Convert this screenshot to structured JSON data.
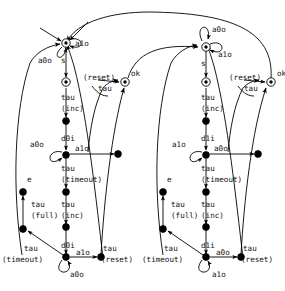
{
  "diagram": {
    "type": "state-transition-diagram",
    "background": "#ffffff",
    "stroke_color": "#000000",
    "text_color": "#111111",
    "width": 285,
    "height": 291,
    "halves": [
      {
        "id": "left",
        "data_in": "d0i",
        "ack_out": "a0o",
        "ack_in": "a1o"
      },
      {
        "id": "right",
        "data_in": "d1i",
        "ack_out": "a1o",
        "ack_in": "a0o"
      }
    ],
    "labels": {
      "start": "s",
      "ok": "ok",
      "e": "e",
      "tau": "tau",
      "inc": "(inc)",
      "full": "(full)",
      "timeout": "(timeout)",
      "reset": "(reset)",
      "a0o": "a0o",
      "a1o": "a1o",
      "d0i": "d0i",
      "d1i": "d1i"
    },
    "left_labels": {
      "self_top": "a1o",
      "self_top2": "a0o",
      "start": "s",
      "tau1": "tau",
      "inc1": "(inc)",
      "din1": "d0i",
      "self_mid": "a0o",
      "ack_mid": "a1o",
      "tau2": "tau",
      "timeout2": "(timeout)",
      "e": "e",
      "tau_full": "tau",
      "full": "(full)",
      "tau_inc2": "tau",
      "inc2": "(inc)",
      "tau_timeout_b": "tau",
      "timeout_b": "(timeout)",
      "din2": "d0i",
      "ack_bot": "a1o",
      "self_bot": "a0o",
      "tau_reset": "tau",
      "reset_r": "(reset)",
      "reset_ok": "(reset)",
      "tau_ok": "tau",
      "ok": "ok"
    },
    "right_labels": {
      "self_top": "a0o",
      "self_top2": "a1o",
      "start": "s",
      "tau1": "tau",
      "inc1": "(inc)",
      "din1": "d1i",
      "self_mid": "a1o",
      "ack_mid": "a0o",
      "tau2": "tau",
      "timeout2": "(timeout)",
      "e": "e",
      "tau_full": "tau",
      "full": "(full)",
      "tau_inc2": "tau",
      "inc2": "(inc)",
      "tau_timeout_b": "tau",
      "timeout_b": "(timeout)",
      "din2": "d1i",
      "ack_bot": "a0o",
      "self_bot": "a1o",
      "tau_reset": "tau",
      "reset_r": "(reset)",
      "reset_ok": "(reset)",
      "tau_ok": "tau",
      "ok": "ok"
    }
  }
}
